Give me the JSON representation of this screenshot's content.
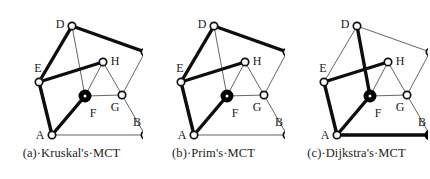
{
  "figure": {
    "background": "#ffffff",
    "vertex_labels": [
      "A",
      "B",
      "C",
      "D",
      "E",
      "F",
      "G",
      "H"
    ],
    "colors": {
      "thick_edge": "#0d0d0d",
      "thin_edge": "#555555",
      "node_fill": "#ffffff",
      "node_stroke": "#111111",
      "filled_node": "#000000",
      "text": "#1a1a1a"
    },
    "vertices": {
      "A": {
        "x": 26,
        "y": 125,
        "label_dx": -12,
        "label_dy": 1
      },
      "B": {
        "x": 119,
        "y": 125,
        "label_dx": -8,
        "label_dy": -12
      },
      "C": {
        "x": 119,
        "y": 42,
        "label_dx": 4,
        "label_dy": -11
      },
      "D": {
        "x": 46,
        "y": 16,
        "label_dx": -12,
        "label_dy": -1
      },
      "E": {
        "x": 13,
        "y": 72,
        "label_dx": -1,
        "label_dy": -13
      },
      "F": {
        "x": 59,
        "y": 86,
        "label_dx": 8,
        "label_dy": 18
      },
      "G": {
        "x": 96,
        "y": 85,
        "label_dx": -7,
        "label_dy": 13
      },
      "H": {
        "x": 77,
        "y": 52,
        "label_dx": 12,
        "label_dy": 0
      }
    },
    "edges": [
      {
        "from": "D",
        "to": "E"
      },
      {
        "from": "D",
        "to": "C"
      },
      {
        "from": "D",
        "to": "F"
      },
      {
        "from": "E",
        "to": "H"
      },
      {
        "from": "E",
        "to": "A"
      },
      {
        "from": "A",
        "to": "F"
      },
      {
        "from": "A",
        "to": "B"
      },
      {
        "from": "B",
        "to": "C"
      },
      {
        "from": "B",
        "to": "G"
      },
      {
        "from": "C",
        "to": "G"
      },
      {
        "from": "F",
        "to": "H"
      },
      {
        "from": "F",
        "to": "G"
      },
      {
        "from": "G",
        "to": "H"
      }
    ],
    "panels": [
      {
        "id": "a",
        "caption": "(a)·Kruskal's·MCT",
        "tree_edges": [
          "D-E",
          "D-C",
          "E-H",
          "E-A",
          "A-F",
          "B-C"
        ],
        "source_vertex": "F",
        "filled_vertices": [
          "F"
        ]
      },
      {
        "id": "b",
        "caption": "(b)·Prim's·MCT",
        "tree_edges": [
          "D-E",
          "D-C",
          "E-H",
          "E-A",
          "A-F",
          "B-C"
        ],
        "source_vertex": "F",
        "filled_vertices": [
          "F"
        ]
      },
      {
        "id": "c",
        "caption": "(c)·Dijkstra's·MCT",
        "tree_edges": [
          "D-F",
          "E-H",
          "E-A",
          "A-F",
          "A-B"
        ],
        "source_vertex": "F",
        "filled_vertices": [
          "F",
          "B"
        ]
      }
    ]
  }
}
